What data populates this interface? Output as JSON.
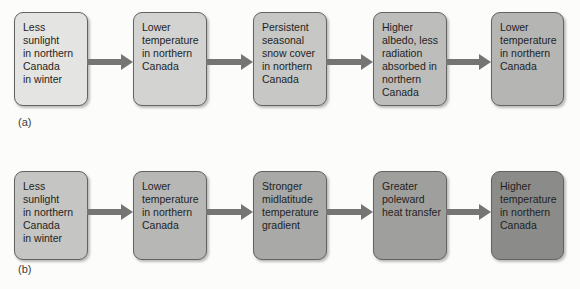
{
  "page": {
    "background": "#fcfcfa"
  },
  "arrow": {
    "color": "#757573"
  },
  "box_style": {
    "border_color": "#636361",
    "text_color": "#1f1f1f"
  },
  "rows": [
    {
      "label": "(a)",
      "boxes": [
        {
          "text": "Less\nsunlight\nin northern\nCanada\nin winter",
          "fill": "#e4e4e2"
        },
        {
          "text": "Lower\ntemperature\nin northern\nCanada",
          "fill": "#d3d3d1"
        },
        {
          "text": "Persistent\nseasonal\nsnow cover\nin northern\nCanada",
          "fill": "#c7c7c5"
        },
        {
          "text": "Higher\nalbedo, less\nradiation\nabsorbed in\nnorthern\nCanada",
          "fill": "#bdbdbb"
        },
        {
          "text": "Lower\ntemperature\nin northern\nCanada",
          "fill": "#b5b5b3"
        }
      ]
    },
    {
      "label": "(b)",
      "boxes": [
        {
          "text": "Less\nsunlight\nin northern\nCanada\nin winter",
          "fill": "#c5c5c3"
        },
        {
          "text": "Lower\ntemperature\nin northern\nCanada",
          "fill": "#b7b7b5"
        },
        {
          "text": "Stronger\nmidlatitude\ntemperature\ngradient",
          "fill": "#a9a9a7"
        },
        {
          "text": "Greater\npoleward\nheat transfer",
          "fill": "#9f9f9d"
        },
        {
          "text": "Higher\ntemperature\nin northern\nCanada",
          "fill": "#8b8b89"
        }
      ]
    }
  ]
}
